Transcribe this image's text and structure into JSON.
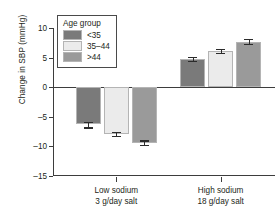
{
  "chart_data": {
    "type": "bar",
    "title": "",
    "xlabel": "",
    "ylabel": "Change in SBP (mmHg)",
    "ylim": [
      -15,
      10
    ],
    "yticks": [
      10,
      5,
      0,
      -5,
      -10,
      -15
    ],
    "ytick_labels": [
      "10",
      "5",
      "0",
      "–5",
      "–10",
      "–15"
    ],
    "grid": false,
    "legend_position": "upper-left-inside",
    "legend_title": "Age group",
    "categories": [
      "Low sodium\n3 g/day salt",
      "High sodium\n18 g/day salt"
    ],
    "category_lines": [
      [
        "Low sodium",
        "3 g/day salt"
      ],
      [
        "High sodium",
        "18 g/day salt"
      ]
    ],
    "series": [
      {
        "name": "<35",
        "color": "#7a7a7a",
        "values": [
          -6.3,
          4.8
        ],
        "errors": [
          0.5,
          0.35
        ]
      },
      {
        "name": "35–44",
        "color": "#ebebeb",
        "values": [
          -7.9,
          6.1
        ],
        "errors": [
          0.3,
          0.3
        ]
      },
      {
        "name": ">44",
        "color": "#9a9a9a",
        "values": [
          -9.4,
          7.7
        ],
        "errors": [
          0.4,
          0.4
        ]
      }
    ]
  },
  "axis": {
    "line_color": "#3d3d3d",
    "zero_line_color": "#3d3d3d",
    "error_bar_color": "#2b2b2b"
  }
}
